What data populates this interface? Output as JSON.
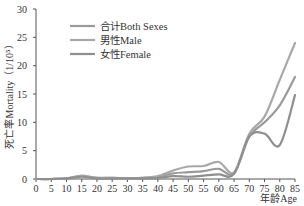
{
  "chart_data": {
    "type": "line",
    "title": "",
    "xlabel": "年龄Age",
    "ylabel": "死亡率Mortality（1/10⁵）",
    "xlim": [
      0,
      85
    ],
    "ylim": [
      0,
      30
    ],
    "x_ticks": [
      0,
      5,
      10,
      15,
      20,
      25,
      30,
      35,
      40,
      45,
      50,
      55,
      60,
      65,
      70,
      75,
      80,
      85
    ],
    "y_ticks": [
      0,
      5,
      10,
      15,
      20,
      25,
      30
    ],
    "grid": false,
    "legend_position": "top-left",
    "x": [
      0,
      5,
      10,
      15,
      20,
      25,
      30,
      35,
      40,
      45,
      50,
      55,
      60,
      65,
      70,
      75,
      80,
      85
    ],
    "series": [
      {
        "name": "合计Both Sexes",
        "color": "#9a9a9a",
        "values": [
          0,
          0,
          0.1,
          0.5,
          0.2,
          0.2,
          0.1,
          0.2,
          0.4,
          1.0,
          1.2,
          1.4,
          1.8,
          1.0,
          7.5,
          10.0,
          13.0,
          18.0
        ]
      },
      {
        "name": "男性Male",
        "color": "#a8a8a8",
        "values": [
          0,
          0,
          0.1,
          0.6,
          0.2,
          0.2,
          0.1,
          0.2,
          0.5,
          1.5,
          2.2,
          2.3,
          3.0,
          1.2,
          8.0,
          11.0,
          17.5,
          24.0
        ]
      },
      {
        "name": "女性Female",
        "color": "#8f8f8f",
        "values": [
          0,
          0,
          0.1,
          0.4,
          0.1,
          0.1,
          0.1,
          0.1,
          0.2,
          0.5,
          0.4,
          0.6,
          0.8,
          0.9,
          7.5,
          8.0,
          6.0,
          14.8
        ]
      }
    ]
  }
}
